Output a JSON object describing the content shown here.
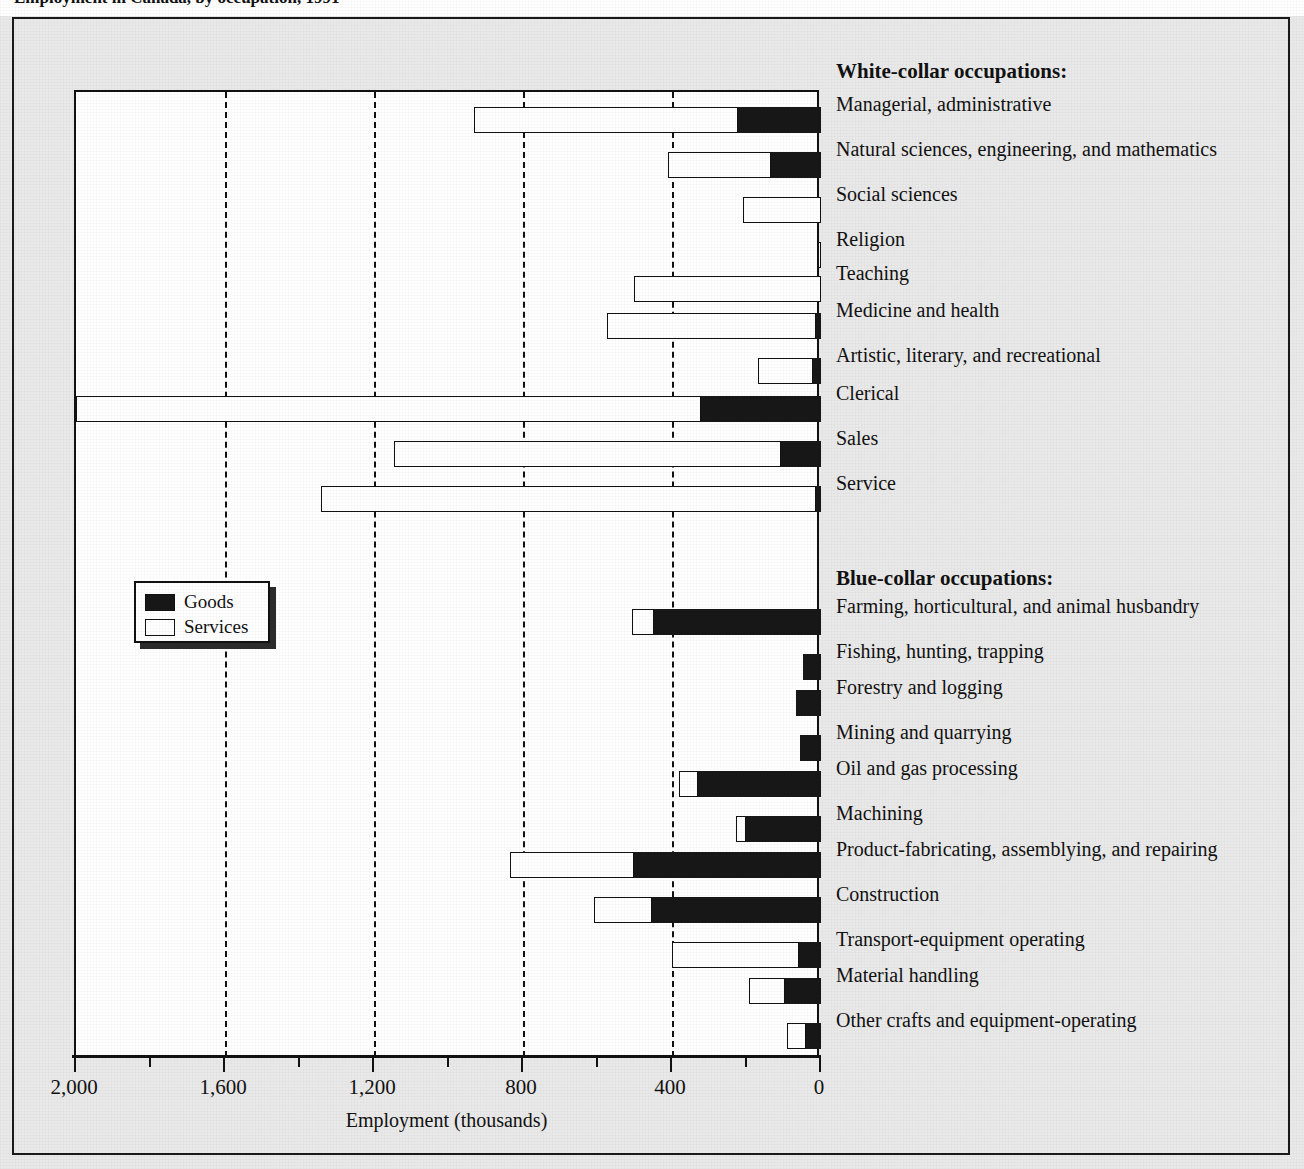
{
  "figure": {
    "caption_clipped": "Employment in Canada, by occupation, 1991",
    "xlabel": "Employment (thousands)",
    "group_white": "White-collar occupations:",
    "group_blue": "Blue-collar occupations:"
  },
  "legend": {
    "position": "inside-left",
    "items": [
      {
        "label": "Goods",
        "color": "#171717",
        "swatch": "goods"
      },
      {
        "label": "Services",
        "color": "#ffffff",
        "swatch": "services"
      }
    ]
  },
  "axis": {
    "ticks_labeled": [
      "2,000",
      "1,600",
      "1,200",
      "800",
      "400",
      "0"
    ],
    "tick_values": [
      2000,
      1600,
      1200,
      800,
      400,
      0
    ],
    "minor_tick_values": [
      1800,
      1400,
      1000,
      600,
      200
    ],
    "gridline_values": [
      1600,
      1200,
      800,
      400
    ],
    "reversed": true,
    "min": 0,
    "max": 2000
  },
  "colors": {
    "page_background": "#e9e9e9",
    "plot_background": "#ffffff",
    "ink": "#111111",
    "goods": "#171717",
    "services": "#ffffff"
  },
  "chart_data": {
    "type": "bar",
    "orientation": "horizontal-stacked",
    "title": "Employment in Canada, by occupation, 1991",
    "xlabel": "Employment (thousands)",
    "ylabel": "",
    "xlim": [
      2000,
      0
    ],
    "grid": true,
    "legend_position": "inside-left",
    "series": [
      {
        "name": "Goods",
        "values": [
          223,
          134,
          0,
          0,
          0,
          13,
          22,
          322,
          107,
          13,
          448,
          48,
          67,
          56,
          330,
          201,
          502,
          454,
          59,
          97,
          40
        ]
      },
      {
        "name": "Services",
        "values": [
          708,
          277,
          209,
          8,
          502,
          561,
          148,
          1678,
          1039,
          1329,
          59,
          0,
          0,
          0,
          51,
          27,
          333,
          156,
          341,
          97,
          51
        ]
      }
    ],
    "categories": [
      "Managerial, administrative",
      "Natural sciences, engineering, and mathematics",
      "Social sciences",
      "Religion",
      "Teaching",
      "Medicine and health",
      "Artistic, literary, and recreational",
      "Clerical",
      "Sales",
      "Service",
      "Farming, horticultural, and animal husbandry",
      "Fishing, hunting, trapping",
      "Forestry and logging",
      "Mining and quarrying",
      "Oil and gas processing",
      "Machining",
      "Product-fabricating, assemblying, and repairing",
      "Construction",
      "Transport-equipment operating",
      "Material handling",
      "Other crafts and equipment-operating"
    ],
    "category_groups": [
      "White-collar",
      "White-collar",
      "White-collar",
      "White-collar",
      "White-collar",
      "White-collar",
      "White-collar",
      "White-collar",
      "White-collar",
      "White-collar",
      "Blue-collar",
      "Blue-collar",
      "Blue-collar",
      "Blue-collar",
      "Blue-collar",
      "Blue-collar",
      "Blue-collar",
      "Blue-collar",
      "Blue-collar",
      "Blue-collar",
      "Blue-collar"
    ],
    "rows": [
      {
        "label": "Managerial, administrative",
        "group": "White-collar",
        "goods": 223,
        "services": 708,
        "total": 931,
        "y": 86
      },
      {
        "label": "Natural sciences, engineering, and mathematics",
        "group": "White-collar",
        "goods": 134,
        "services": 277,
        "total": 411,
        "y": 131
      },
      {
        "label": "Social sciences",
        "group": "White-collar",
        "goods": 0,
        "services": 209,
        "total": 209,
        "y": 176
      },
      {
        "label": "Religion",
        "group": "White-collar",
        "goods": 0,
        "services": 8,
        "total": 8,
        "y": 221
      },
      {
        "label": "Teaching",
        "group": "White-collar",
        "goods": 0,
        "services": 502,
        "total": 502,
        "y": 255
      },
      {
        "label": "Medicine and health",
        "group": "White-collar",
        "goods": 13,
        "services": 561,
        "total": 574,
        "y": 292
      },
      {
        "label": "Artistic, literary, and recreational",
        "group": "White-collar",
        "goods": 22,
        "services": 148,
        "total": 170,
        "y": 337
      },
      {
        "label": "Clerical",
        "group": "White-collar",
        "goods": 322,
        "services": 1678,
        "total": 2000,
        "y": 375
      },
      {
        "label": "Sales",
        "group": "White-collar",
        "goods": 107,
        "services": 1039,
        "total": 1146,
        "y": 420
      },
      {
        "label": "Service",
        "group": "White-collar",
        "goods": 13,
        "services": 1329,
        "total": 1342,
        "y": 465
      },
      {
        "label": "Farming, horticultural, and animal husbandry",
        "group": "Blue-collar",
        "goods": 448,
        "services": 59,
        "total": 507,
        "y": 588
      },
      {
        "label": "Fishing, hunting, trapping",
        "group": "Blue-collar",
        "goods": 48,
        "services": 0,
        "total": 48,
        "y": 633
      },
      {
        "label": "Forestry and logging",
        "group": "Blue-collar",
        "goods": 67,
        "services": 0,
        "total": 67,
        "y": 669
      },
      {
        "label": "Mining and quarrying",
        "group": "Blue-collar",
        "goods": 56,
        "services": 0,
        "total": 56,
        "y": 714
      },
      {
        "label": "Oil and gas processing",
        "group": "Blue-collar",
        "goods": 330,
        "services": 51,
        "total": 381,
        "y": 750
      },
      {
        "label": "Machining",
        "group": "Blue-collar",
        "goods": 201,
        "services": 27,
        "total": 228,
        "y": 795
      },
      {
        "label": "Product-fabricating, assemblying, and repairing",
        "group": "Blue-collar",
        "goods": 502,
        "services": 333,
        "total": 835,
        "y": 831
      },
      {
        "label": "Construction",
        "group": "Blue-collar",
        "goods": 454,
        "services": 156,
        "total": 610,
        "y": 876
      },
      {
        "label": "Transport-equipment operating",
        "group": "Blue-collar",
        "goods": 59,
        "services": 341,
        "total": 400,
        "y": 921
      },
      {
        "label": "Material handling",
        "group": "Blue-collar",
        "goods": 97,
        "services": 97,
        "total": 194,
        "y": 957
      },
      {
        "label": "Other crafts and equipment-operating",
        "group": "Blue-collar",
        "goods": 40,
        "services": 51,
        "total": 91,
        "y": 1002
      }
    ],
    "label_positions": {
      "group_white_y": 42,
      "group_blue_y": 549
    }
  }
}
